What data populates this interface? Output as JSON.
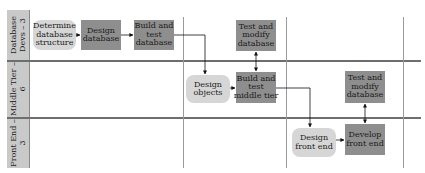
{
  "lanes": [
    {
      "label": "Database\nDevs – 3"
    },
    {
      "label": "Middle Tier –\n6"
    },
    {
      "label": "Front End –\n3"
    }
  ],
  "nodes": {
    "determine_structure": {
      "label": "Determine\ndatabase\nstructure",
      "shape": "rounded"
    },
    "design_database": {
      "label": "Design\ndatabase",
      "shape": "rect"
    },
    "build_test_database": {
      "label": "Build and\ntest\ndatabase",
      "shape": "rect"
    },
    "test_modify_database_1": {
      "label": "Test and\nmodify\ndatabase",
      "shape": "rect"
    },
    "design_objects": {
      "label": "Design\nobjects",
      "shape": "rounded"
    },
    "build_test_middle_tier": {
      "label": "Build and\ntest\nmiddle tier",
      "shape": "rect"
    },
    "test_modify_database_2": {
      "label": "Test and\nmodify\ndatabase",
      "shape": "rect"
    },
    "design_front_end": {
      "label": "Design\nfront end",
      "shape": "rounded"
    },
    "develop_front_end": {
      "label": "Develop\nfront end",
      "shape": "rect"
    }
  },
  "colors": {
    "lane_header": "#c9c9c9",
    "rounded_node": "#d6d6d6",
    "rect_node": "#8e8e8e",
    "line": "#6e6e6e",
    "arrow": "#111111"
  }
}
